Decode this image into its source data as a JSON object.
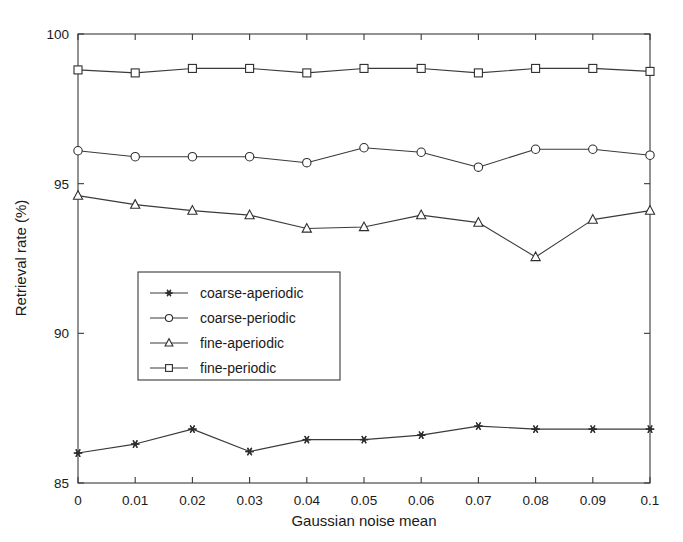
{
  "chart_data": {
    "type": "line",
    "title": "",
    "subtitle": "",
    "xlabel": "Gaussian noise mean",
    "ylabel": "Retrieval rate (%)",
    "x": [
      0,
      0.01,
      0.02,
      0.03,
      0.04,
      0.05,
      0.06,
      0.07,
      0.08,
      0.09,
      0.1
    ],
    "xtick_labels": [
      "0",
      "0.01",
      "0.02",
      "0.03",
      "0.04",
      "0.05",
      "0.06",
      "0.07",
      "0.08",
      "0.09",
      "0.1"
    ],
    "ytick_labels": [
      "85",
      "90",
      "95",
      "100"
    ],
    "yticks": [
      85,
      90,
      95,
      100
    ],
    "xlim": [
      0,
      0.1
    ],
    "ylim": [
      85,
      100
    ],
    "grid": false,
    "legend_position": "center-left",
    "series": [
      {
        "name": "coarse-aperiodic",
        "marker": "star",
        "values": [
          86.0,
          86.3,
          86.8,
          86.05,
          86.45,
          86.45,
          86.6,
          86.9,
          86.8,
          86.8,
          86.8
        ]
      },
      {
        "name": "coarse-periodic",
        "marker": "circle",
        "values": [
          96.1,
          95.9,
          95.9,
          95.9,
          95.7,
          96.2,
          96.05,
          95.55,
          96.15,
          96.15,
          95.95
        ]
      },
      {
        "name": "fine-aperiodic",
        "marker": "triangle",
        "values": [
          94.6,
          94.3,
          94.1,
          93.95,
          93.5,
          93.55,
          93.95,
          93.7,
          92.55,
          93.8,
          94.1
        ]
      },
      {
        "name": "fine-periodic",
        "marker": "square",
        "values": [
          98.8,
          98.7,
          98.85,
          98.85,
          98.7,
          98.85,
          98.85,
          98.7,
          98.85,
          98.85,
          98.75
        ]
      }
    ]
  },
  "legend": {
    "entries": [
      {
        "label": "coarse-aperiodic",
        "marker": "star"
      },
      {
        "label": "coarse-periodic",
        "marker": "circle"
      },
      {
        "label": "fine-aperiodic",
        "marker": "triangle"
      },
      {
        "label": "fine-periodic",
        "marker": "square"
      }
    ]
  },
  "colors": {
    "axis": "#3a3a3a",
    "series": "#2e2e2e",
    "background": "#ffffff",
    "text": "#1a1a1a"
  }
}
